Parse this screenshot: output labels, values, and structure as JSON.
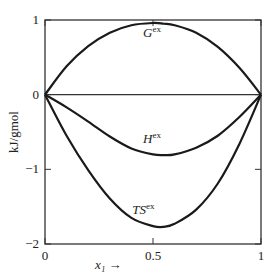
{
  "chart_data": {
    "type": "line",
    "title": "",
    "xlabel": "x₁ →",
    "ylabel": "kJ/gmol",
    "xlim": [
      0,
      1
    ],
    "ylim": [
      -2,
      1
    ],
    "x_ticks": [
      {
        "value": 0,
        "label": "0"
      },
      {
        "value": 0.5,
        "label": "0.5"
      },
      {
        "value": 1,
        "label": "1"
      }
    ],
    "y_ticks": [
      {
        "value": 1,
        "label": "1"
      },
      {
        "value": 0,
        "label": "0"
      },
      {
        "value": -1,
        "label": "−1"
      },
      {
        "value": -2,
        "label": "−2"
      }
    ],
    "grid": false,
    "reference_line": {
      "y": 0
    },
    "x": [
      0,
      0.1,
      0.2,
      0.3,
      0.4,
      0.5,
      0.55,
      0.6,
      0.7,
      0.8,
      0.9,
      1.0
    ],
    "series": [
      {
        "name": "Gex",
        "label_main": "G",
        "label_sup": "ex",
        "values": [
          0,
          0.38,
          0.65,
          0.83,
          0.93,
          0.96,
          0.95,
          0.93,
          0.83,
          0.64,
          0.36,
          0
        ]
      },
      {
        "name": "Hex",
        "label_main": "H",
        "label_sup": "ex",
        "values": [
          0,
          -0.17,
          -0.36,
          -0.56,
          -0.72,
          -0.8,
          -0.81,
          -0.8,
          -0.71,
          -0.55,
          -0.3,
          0
        ]
      },
      {
        "name": "TSex",
        "label_main": "TS",
        "label_sup": "ex",
        "values": [
          0,
          -0.55,
          -1.01,
          -1.39,
          -1.65,
          -1.76,
          -1.77,
          -1.73,
          -1.54,
          -1.19,
          -0.66,
          0
        ]
      }
    ],
    "annotations": [
      {
        "text": "Gex",
        "x": 0.5,
        "y": 0.82
      },
      {
        "text": "Hex",
        "x": 0.5,
        "y": -0.6
      },
      {
        "text": "TSex",
        "x": 0.45,
        "y": -1.55
      }
    ]
  }
}
